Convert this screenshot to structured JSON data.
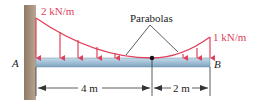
{
  "diagram": {
    "type": "cantilever-beam-distributed-load",
    "load_left": "2 kN/m",
    "load_right": "1 kN/m",
    "curve_label": "Parabolas",
    "point_a": "A",
    "point_b": "B",
    "dim_left": "4 m",
    "dim_right": "2 m",
    "colors": {
      "load": "#e0405a",
      "beam": "#9fbfd6",
      "wall": "#a89480",
      "dimension": "#333333"
    }
  }
}
